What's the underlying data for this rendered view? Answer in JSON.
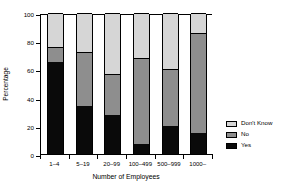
{
  "chart_data": {
    "type": "bar",
    "subtype": "stacked-bar-100-percent",
    "title": "",
    "xlabel": "Number of Employees",
    "ylabel": "Percentage",
    "categories": [
      "1–4",
      "5–19",
      "20–99",
      "100–499",
      "500–999",
      "1000–"
    ],
    "series": [
      {
        "name": "Yes",
        "color": "#0a0a0a",
        "values": [
          65,
          34,
          28,
          7,
          20,
          15
        ]
      },
      {
        "name": "No",
        "color": "#8e8e8e",
        "values": [
          11,
          38,
          29,
          61,
          40,
          71
        ]
      },
      {
        "name": "Don't Know",
        "color": "#d6d6d6",
        "values": [
          24,
          28,
          43,
          32,
          40,
          14
        ]
      }
    ],
    "cumulative_tops": {
      "yes": [
        65,
        34,
        28,
        7,
        20,
        15
      ],
      "yes_plus_no": [
        76,
        72,
        57,
        68,
        60,
        86
      ],
      "total": [
        100,
        100,
        100,
        100,
        100,
        100
      ]
    },
    "ylim": [
      0,
      100
    ],
    "yticks": [
      0,
      20,
      40,
      60,
      80,
      100
    ],
    "ytick_labels": [
      "0",
      "20",
      "40",
      "60",
      "80",
      "100"
    ],
    "grid": false,
    "legend_position": "right",
    "legend_entries": [
      {
        "label": "Don't Know",
        "color": "#d6d6d6"
      },
      {
        "label": "No",
        "color": "#8e8e8e"
      },
      {
        "label": "Yes",
        "color": "#0a0a0a"
      }
    ]
  }
}
